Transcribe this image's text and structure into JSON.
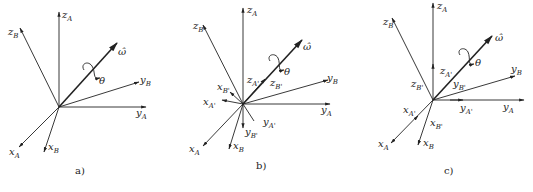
{
  "figures": [
    {
      "caption": "a)",
      "labels": {
        "zA": "z",
        "zA_sub": "A",
        "zB": "z",
        "zB_sub": "B",
        "omega": "ω̂",
        "theta": "θ",
        "yB": "y",
        "yB_sub": "B",
        "yA": "y",
        "yA_sub": "A",
        "xA": "x",
        "xA_sub": "A",
        "xB": "x",
        "xB_sub": "B"
      }
    },
    {
      "caption": "b)",
      "labels": {
        "zA": "z",
        "zA_sub": "A",
        "zB": "z",
        "zB_sub": "B",
        "omega": "ω̂",
        "theta": "θ",
        "yB": "y",
        "yB_sub": "B",
        "yA": "y",
        "yA_sub": "A",
        "xA": "x",
        "xA_sub": "A",
        "xB": "x",
        "xB_sub": "B",
        "zAp": "z",
        "zAp_sub": "A'",
        "zBp": "z",
        "zBp_sub": "B'",
        "xBp": "x",
        "xBp_sub": "B'",
        "xAp": "x",
        "xAp_sub": "A'",
        "yAp": "y",
        "yAp_sub": "A'",
        "yBp": "y",
        "yBp_sub": "B'"
      }
    },
    {
      "caption": "c)",
      "labels": {
        "zA": "z",
        "zA_sub": "A",
        "zB": "z",
        "zB_sub": "B",
        "omega": "ω̂",
        "theta": "θ",
        "yB": "y",
        "yB_sub": "B",
        "yA": "y",
        "yA_sub": "A",
        "xA": "x",
        "xA_sub": "A",
        "xB": "x",
        "xB_sub": "B",
        "zAp": "z",
        "zAp_sub": "A'",
        "zBp": "z",
        "zBp_sub": "B'",
        "yBp": "y",
        "yBp_sub": "B'",
        "xAp": "x",
        "xAp_sub": "A'",
        "yAp": "y",
        "yAp_sub": "A'",
        "xBp": "x",
        "xBp_sub": "B'"
      }
    }
  ]
}
